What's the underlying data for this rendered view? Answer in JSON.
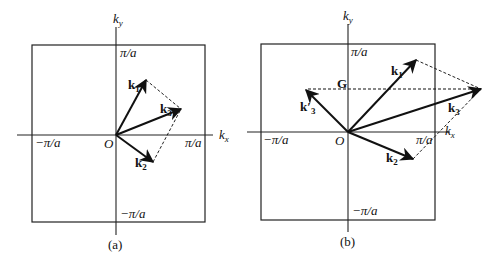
{
  "figure": {
    "panel_a": {
      "caption": "(a)",
      "axis_x_label": "k",
      "axis_x_sub": "x",
      "axis_y_label": "k",
      "axis_y_sub": "y",
      "origin_label": "O",
      "tick_pos_x": "π/a",
      "tick_neg_x": "−π/a",
      "tick_pos_y": "π/a",
      "tick_neg_y": "−π/a",
      "vectors": [
        {
          "name": "k",
          "sub": "1"
        },
        {
          "name": "k",
          "sub": "2"
        },
        {
          "name": "k",
          "sub": "3"
        }
      ]
    },
    "panel_b": {
      "caption": "(b)",
      "axis_x_label": "k",
      "axis_x_sub": "x",
      "axis_y_label": "k",
      "axis_y_sub": "y",
      "origin_label": "O",
      "tick_pos_x": "π/a",
      "tick_neg_x": "−π/a",
      "tick_pos_y": "π/a",
      "tick_neg_y": "−π/a",
      "reciprocal_vector": "G",
      "vectors": [
        {
          "name": "k",
          "sub": "1"
        },
        {
          "name": "k",
          "sub": "2"
        },
        {
          "name": "k",
          "sub": "3"
        },
        {
          "name": "k′",
          "sub": "3"
        }
      ]
    }
  }
}
